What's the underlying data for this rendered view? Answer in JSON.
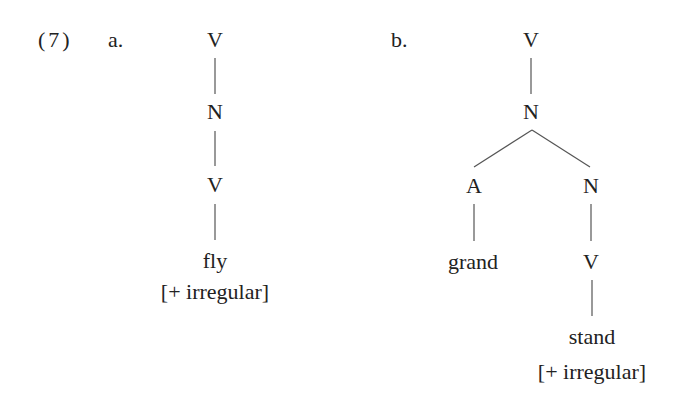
{
  "example": {
    "number": "(7)",
    "tree_a": {
      "label": "a.",
      "nodes": [
        "V",
        "N",
        "V",
        "fly",
        "[+ irregular]"
      ]
    },
    "tree_b": {
      "label": "b.",
      "root": "V",
      "n1": "N",
      "left": "A",
      "left_leaf": "grand",
      "right": "N",
      "right_v": "V",
      "right_leaf": "stand",
      "feature": "[+ irregular]"
    }
  }
}
